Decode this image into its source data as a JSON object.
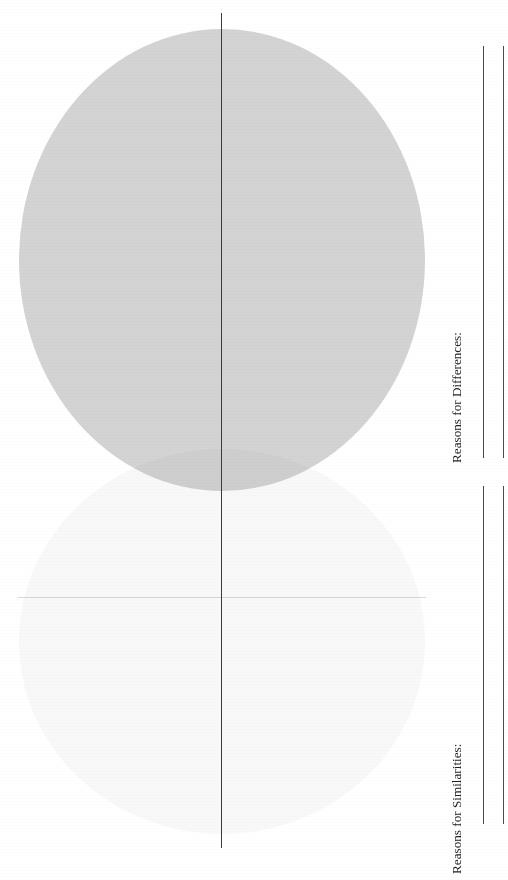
{
  "worksheet": {
    "type": "venn-diagram-worksheet",
    "orientation": "rotated-90-counterclockwise",
    "background_color": "#ffffff"
  },
  "venn": {
    "circle_top": {
      "name": "upper-set-region",
      "fill_color": "#bfbfbf",
      "label": ""
    },
    "circle_bottom": {
      "name": "lower-set-region",
      "fill_color": "#f5f5f5",
      "label": ""
    },
    "overlap": {
      "name": "intersection-region",
      "fill_color": "#b5b5b5",
      "label": ""
    },
    "divider": {
      "name": "center-fold-line",
      "color": "#3a3a42"
    },
    "rule": {
      "name": "faint-horizontal-rule",
      "color": "#8f8f8f"
    }
  },
  "sections": [
    {
      "id": "differences",
      "label": "Reasons for Differences:",
      "line_count": 2
    },
    {
      "id": "similarities",
      "label": "Reasons for Similarities:",
      "line_count": 2
    }
  ]
}
